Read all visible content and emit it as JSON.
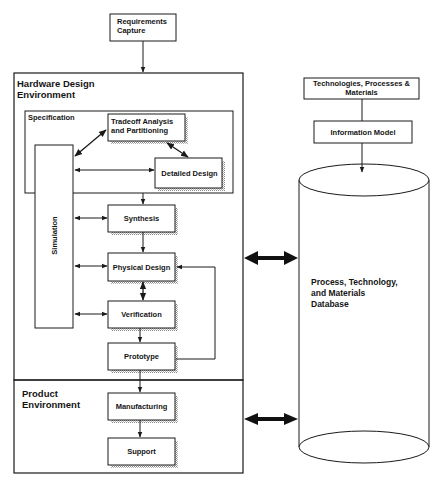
{
  "diagram": {
    "type": "flowchart",
    "top_box": {
      "label_line1": "Requirements",
      "label_line2": "Capture"
    },
    "hardware_env": {
      "title_line1": "Hardware Design",
      "title_line2": "Environment",
      "specification": {
        "title": "Specification"
      },
      "nodes": {
        "tradeoff": {
          "line1": "Tradeoff Analysis",
          "line2": "and Partitioning"
        },
        "detailed_design": "Detailed Design",
        "simulation": "Simulation",
        "synthesis": "Synthesis",
        "physical_design": "Physical Design",
        "verification": "Verification",
        "prototype": "Prototype"
      }
    },
    "product_env": {
      "title_line1": "Product",
      "title_line2": "Environment",
      "nodes": {
        "manufacturing": "Manufacturing",
        "support": "Support"
      }
    },
    "right_column": {
      "tech_box": {
        "line1": "Technologies, Processes &",
        "line2": "Materials"
      },
      "info_model": "Information Model",
      "database": {
        "line1": "Process, Technology,",
        "line2": "and Materials",
        "line3": "Database"
      }
    },
    "edges": [
      {
        "from": "Requirements Capture",
        "to": "Hardware Design Environment",
        "type": "arrow"
      },
      {
        "from": "Tradeoff Analysis and Partitioning",
        "to": "Simulation",
        "type": "bidirectional"
      },
      {
        "from": "Tradeoff Analysis and Partitioning",
        "to": "Detailed Design",
        "type": "bidirectional"
      },
      {
        "from": "Simulation",
        "to": "Detailed Design",
        "type": "bidirectional"
      },
      {
        "from": "Specification",
        "to": "Synthesis",
        "type": "arrow"
      },
      {
        "from": "Simulation",
        "to": "Synthesis",
        "type": "bidirectional"
      },
      {
        "from": "Synthesis",
        "to": "Physical Design",
        "type": "arrow"
      },
      {
        "from": "Simulation",
        "to": "Physical Design",
        "type": "bidirectional"
      },
      {
        "from": "Physical Design",
        "to": "Verification",
        "type": "bidirectional"
      },
      {
        "from": "Simulation",
        "to": "Verification",
        "type": "bidirectional"
      },
      {
        "from": "Verification",
        "to": "Prototype",
        "type": "arrow"
      },
      {
        "from": "Prototype",
        "to": "Physical Design",
        "type": "feedback-arrow"
      },
      {
        "from": "Prototype",
        "to": "Manufacturing",
        "type": "arrow"
      },
      {
        "from": "Manufacturing",
        "to": "Support",
        "type": "arrow"
      },
      {
        "from": "Hardware Design Environment",
        "to": "Database",
        "type": "bidirectional-thick"
      },
      {
        "from": "Product Environment",
        "to": "Database",
        "type": "bidirectional-thick"
      },
      {
        "from": "Technologies, Processes & Materials",
        "to": "Information Model",
        "type": "line"
      },
      {
        "from": "Information Model",
        "to": "Database",
        "type": "arrow"
      }
    ],
    "colors": {
      "stroke": "#1a1a1a",
      "shadow": "#9a9a9a",
      "background": "#ffffff"
    }
  }
}
